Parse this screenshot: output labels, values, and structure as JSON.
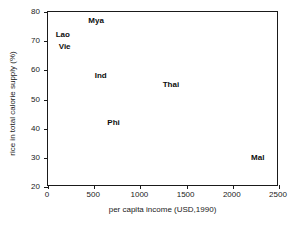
{
  "chart_data": {
    "type": "scatter",
    "title": "",
    "xlabel": "per capita income (USD,1990)",
    "ylabel": "rice in total calorie supply (%)",
    "xlim": [
      0,
      2500
    ],
    "ylim": [
      20,
      80
    ],
    "xticks": [
      0,
      500,
      1000,
      1500,
      2000,
      2500
    ],
    "yticks": [
      20,
      30,
      40,
      50,
      60,
      70,
      80
    ],
    "xtick_labels": [
      "0",
      "500",
      "1000",
      "1500",
      "2000",
      "2500"
    ],
    "ytick_labels": [
      "20",
      "30",
      "40",
      "50",
      "60",
      "70",
      "80"
    ],
    "grid": false,
    "legend": null,
    "marker_style": "text-label",
    "points": [
      {
        "label": "Mya",
        "x": 520,
        "y": 77
      },
      {
        "label": "Lao",
        "x": 160,
        "y": 72
      },
      {
        "label": "Vie",
        "x": 180,
        "y": 68
      },
      {
        "label": "Ind",
        "x": 570,
        "y": 58
      },
      {
        "label": "Thai",
        "x": 1330,
        "y": 55
      },
      {
        "label": "Phi",
        "x": 710,
        "y": 42
      },
      {
        "label": "Mal",
        "x": 2270,
        "y": 30
      }
    ]
  },
  "colors": {
    "axis": "#1a1a1a",
    "text": "#0d0d0d",
    "background": "#ffffff"
  }
}
